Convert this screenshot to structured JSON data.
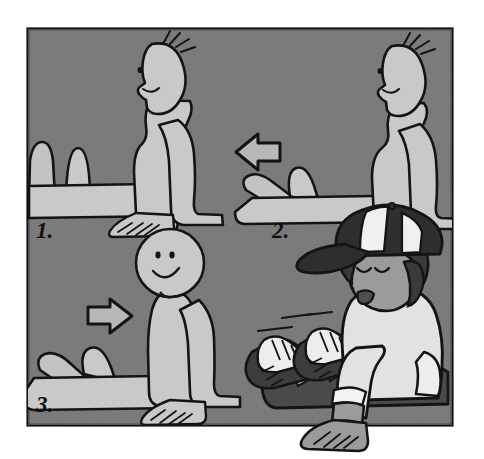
{
  "illustration": {
    "title": "Seated ankle flex exercise — 3 step cartoon instruction",
    "style": "grayscale cartoon line drawing on gray panel",
    "panel": {
      "background_color": "#707070",
      "border_color": "#141414",
      "page_color": "#ffffff"
    },
    "figure_colors": {
      "skin_light": "#c9c9c9",
      "outline": "#141414",
      "shirt_white": "#e2e2e2",
      "hair_dark": "#3a3a3a",
      "pants_dark": "#4a4a4a",
      "shoe_dark": "#3d3d3d",
      "shoe_white": "#ededed",
      "cap_dark": "#2e2e2e",
      "cap_white": "#f0f0f0",
      "skin_medium": "#9b9b9b"
    },
    "steps": [
      {
        "number": "1.",
        "label_x": 36,
        "label_y": 238,
        "description": "Figure seated on floor facing left, legs extended forward, hands on floor behind, feet pointed away (plantar flexion)."
      },
      {
        "number": "2.",
        "label_x": 272,
        "label_y": 238,
        "description": "Figure seated on floor facing right, legs extended to the left, feet flexed back toward body (dorsiflexion)."
      },
      {
        "number": "3.",
        "label_x": 36,
        "label_y": 412,
        "description": "Figure seated facing viewer, smiling, legs extended left, feet pointing sideways."
      }
    ],
    "arrows": [
      {
        "name": "arrow-left",
        "direction": "left",
        "x": 232,
        "y": 133
      },
      {
        "name": "arrow-right",
        "direction": "right",
        "x": 88,
        "y": 297
      }
    ],
    "child": {
      "description": "Real child with dark curly hair wearing a backwards-tilted mesh baseball cap, light sweatshirt with rolled cuffs, dark pants and sneakers, seated on the floor demonstrating the exercise.",
      "cap": "baseball-cap-mesh-panels",
      "shoes": "two sneakers with laces",
      "motion_lines": 3
    }
  }
}
